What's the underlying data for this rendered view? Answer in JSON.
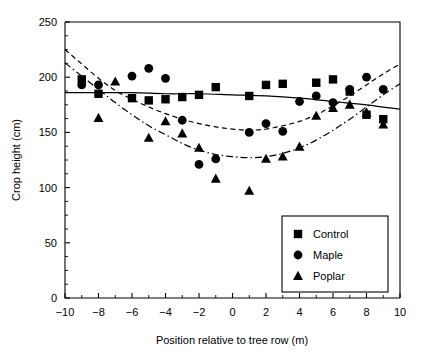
{
  "chart_data": {
    "type": "scatter",
    "title": "",
    "xlabel": "Position relative to tree row (m)",
    "ylabel": "Crop height (cm)",
    "xlim": [
      -10,
      10
    ],
    "ylim": [
      0,
      250
    ],
    "xticks": [
      -10,
      -8,
      -6,
      -4,
      -2,
      0,
      2,
      4,
      6,
      8,
      10
    ],
    "xtick_labels": [
      "−10",
      "−8",
      "−6",
      "−4",
      "−2",
      "0",
      "2",
      "4",
      "6",
      "8",
      "10"
    ],
    "yticks": [
      0,
      50,
      100,
      150,
      200,
      250
    ],
    "ytick_labels": [
      "0",
      "50",
      "100",
      "150",
      "200",
      "250"
    ],
    "x_minor_ticks": [
      -9,
      -7,
      -5,
      -3,
      -1,
      1,
      3,
      5,
      7,
      9
    ],
    "y_minor_ticks": [
      12.5,
      25,
      37.5,
      62.5,
      75,
      87.5,
      112.5,
      125,
      137.5,
      162.5,
      175,
      187.5,
      212.5,
      225,
      237.5
    ],
    "grid": false,
    "legend_position": "lower right",
    "series": [
      {
        "name": "Control",
        "marker": "square",
        "line_style": "solid",
        "points": [
          {
            "x": -9,
            "y": 198
          },
          {
            "x": -8,
            "y": 185
          },
          {
            "x": -6,
            "y": 181
          },
          {
            "x": -5,
            "y": 179
          },
          {
            "x": -4,
            "y": 180
          },
          {
            "x": -3,
            "y": 182
          },
          {
            "x": -2,
            "y": 184
          },
          {
            "x": -1,
            "y": 191
          },
          {
            "x": 1,
            "y": 183
          },
          {
            "x": 2,
            "y": 193
          },
          {
            "x": 3,
            "y": 194
          },
          {
            "x": 5,
            "y": 195
          },
          {
            "x": 6,
            "y": 198
          },
          {
            "x": 7,
            "y": 187
          },
          {
            "x": 8,
            "y": 166
          },
          {
            "x": 9,
            "y": 162
          }
        ],
        "fit": [
          {
            "x": -10,
            "y": 186
          },
          {
            "x": -8,
            "y": 186
          },
          {
            "x": -6,
            "y": 186
          },
          {
            "x": -4,
            "y": 185
          },
          {
            "x": -2,
            "y": 185
          },
          {
            "x": 0,
            "y": 184
          },
          {
            "x": 2,
            "y": 183
          },
          {
            "x": 4,
            "y": 181
          },
          {
            "x": 6,
            "y": 178
          },
          {
            "x": 8,
            "y": 175
          },
          {
            "x": 10,
            "y": 171
          }
        ]
      },
      {
        "name": "Maple",
        "marker": "circle",
        "line_style": "dashed",
        "points": [
          {
            "x": -9,
            "y": 193
          },
          {
            "x": -8,
            "y": 193
          },
          {
            "x": -6,
            "y": 201
          },
          {
            "x": -5,
            "y": 208
          },
          {
            "x": -4,
            "y": 199
          },
          {
            "x": -3,
            "y": 161
          },
          {
            "x": -2,
            "y": 121
          },
          {
            "x": -1,
            "y": 126
          },
          {
            "x": 1,
            "y": 150
          },
          {
            "x": 2,
            "y": 158
          },
          {
            "x": 3,
            "y": 151
          },
          {
            "x": 4,
            "y": 178
          },
          {
            "x": 5,
            "y": 183
          },
          {
            "x": 6,
            "y": 177
          },
          {
            "x": 7,
            "y": 189
          },
          {
            "x": 8,
            "y": 200
          },
          {
            "x": 9,
            "y": 189
          }
        ],
        "fit": [
          {
            "x": -10,
            "y": 225
          },
          {
            "x": -9,
            "y": 212
          },
          {
            "x": -8,
            "y": 199
          },
          {
            "x": -7,
            "y": 188
          },
          {
            "x": -6,
            "y": 180
          },
          {
            "x": -5,
            "y": 173
          },
          {
            "x": -4,
            "y": 167
          },
          {
            "x": -3,
            "y": 162
          },
          {
            "x": -2,
            "y": 158
          },
          {
            "x": -1,
            "y": 155
          },
          {
            "x": 0,
            "y": 153
          },
          {
            "x": 1,
            "y": 152
          },
          {
            "x": 2,
            "y": 153
          },
          {
            "x": 3,
            "y": 156
          },
          {
            "x": 4,
            "y": 160
          },
          {
            "x": 5,
            "y": 166
          },
          {
            "x": 6,
            "y": 174
          },
          {
            "x": 7,
            "y": 183
          },
          {
            "x": 8,
            "y": 193
          },
          {
            "x": 9,
            "y": 203
          },
          {
            "x": 10,
            "y": 212
          }
        ]
      },
      {
        "name": "Poplar",
        "marker": "triangle",
        "line_style": "dashdot",
        "points": [
          {
            "x": -8,
            "y": 163
          },
          {
            "x": -7,
            "y": 196
          },
          {
            "x": -5,
            "y": 145
          },
          {
            "x": -4,
            "y": 160
          },
          {
            "x": -3,
            "y": 149
          },
          {
            "x": -2,
            "y": 136
          },
          {
            "x": -1,
            "y": 108
          },
          {
            "x": 1,
            "y": 97
          },
          {
            "x": 2,
            "y": 126
          },
          {
            "x": 3,
            "y": 128
          },
          {
            "x": 4,
            "y": 137
          },
          {
            "x": 5,
            "y": 165
          },
          {
            "x": 6,
            "y": 172
          },
          {
            "x": 7,
            "y": 175
          },
          {
            "x": 8,
            "y": 168
          },
          {
            "x": 9,
            "y": 157
          }
        ],
        "fit": [
          {
            "x": -10,
            "y": 213
          },
          {
            "x": -9,
            "y": 201
          },
          {
            "x": -8,
            "y": 189
          },
          {
            "x": -7,
            "y": 177
          },
          {
            "x": -6,
            "y": 166
          },
          {
            "x": -5,
            "y": 156
          },
          {
            "x": -4,
            "y": 148
          },
          {
            "x": -3,
            "y": 140
          },
          {
            "x": -2,
            "y": 134
          },
          {
            "x": -1,
            "y": 130
          },
          {
            "x": 0,
            "y": 128
          },
          {
            "x": 1,
            "y": 127
          },
          {
            "x": 2,
            "y": 128
          },
          {
            "x": 3,
            "y": 131
          },
          {
            "x": 4,
            "y": 136
          },
          {
            "x": 5,
            "y": 143
          },
          {
            "x": 6,
            "y": 152
          },
          {
            "x": 7,
            "y": 162
          },
          {
            "x": 8,
            "y": 173
          },
          {
            "x": 9,
            "y": 184
          },
          {
            "x": 10,
            "y": 194
          }
        ]
      }
    ]
  },
  "legend": {
    "items": [
      {
        "label": "Control",
        "marker": "square-icon"
      },
      {
        "label": "Maple",
        "marker": "circle-icon"
      },
      {
        "label": "Poplar",
        "marker": "triangle-icon"
      }
    ]
  },
  "colors": {
    "foreground": "#000000",
    "background": "#ffffff"
  }
}
